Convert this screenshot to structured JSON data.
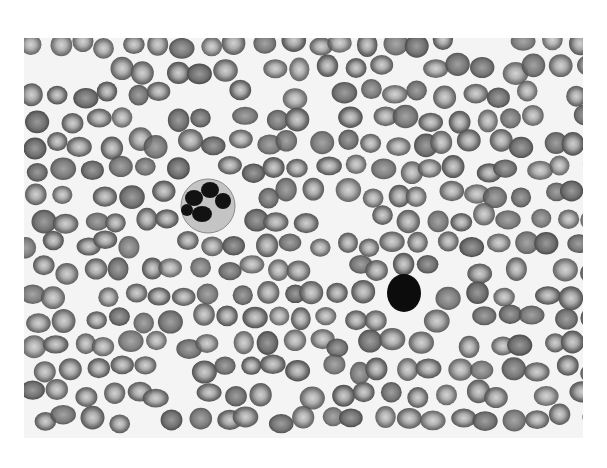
{
  "image": {
    "subject": "peripheral blood smear micrograph (grayscale)",
    "colors": {
      "background": "#ffffff",
      "plasma": "#f4f4f4",
      "rbc_rim": "#5e5e5e",
      "rbc_center": "#c8c8c8",
      "nucleus": "#111111",
      "cytoplasm": "#bdbdbd"
    },
    "features": [
      {
        "name": "neutrophil",
        "cx": 184,
        "cy": 168,
        "r": 27
      },
      {
        "name": "lymphocyte",
        "cx": 380,
        "cy": 255,
        "r": 19
      }
    ]
  }
}
